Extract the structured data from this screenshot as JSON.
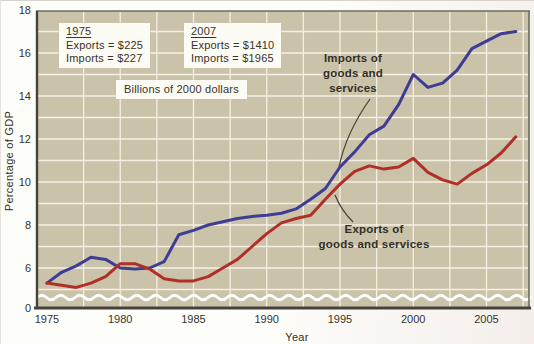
{
  "figure": {
    "y_axis_title": "Percentage of GDP",
    "x_axis_title": "Year",
    "note_box": "Billions of 2000 dollars",
    "legend_boxes": [
      {
        "title": "1975",
        "rows": [
          "Exports = $225",
          "Imports = $227"
        ]
      },
      {
        "title": "2007",
        "rows": [
          "Exports = $1410",
          "Imports = $1965"
        ]
      }
    ],
    "annotations": {
      "imports": {
        "lines": [
          "Imports of",
          "goods and",
          "services"
        ]
      },
      "exports": {
        "lines": [
          "Exports of",
          "goods and services"
        ]
      }
    }
  },
  "colors": {
    "plot_bg": "#cbc2aa",
    "grid": "#f4f0e2",
    "imports_line": "#3d3d94",
    "exports_line": "#b02f27",
    "axis": "#44423c",
    "frame": "#66705c",
    "text": "#37332c",
    "wave": "#ffffff",
    "leader": "#4c463a",
    "box_bg": "#fcfbf4"
  },
  "chart_data": {
    "type": "line",
    "xlabel": "Year",
    "ylabel": "Percentage of GDP",
    "ylim": [
      0,
      18
    ],
    "y_ticks": [
      0,
      6,
      8,
      10,
      12,
      14,
      16,
      18
    ],
    "x_ticks": [
      1975,
      1980,
      1985,
      1990,
      1995,
      2000,
      2005
    ],
    "y_gridline_step": 1,
    "x_gridline_step": 2.5,
    "axis_break_below": 5,
    "grid": true,
    "x": [
      1975,
      1976,
      1977,
      1978,
      1979,
      1980,
      1981,
      1982,
      1983,
      1984,
      1985,
      1986,
      1987,
      1988,
      1989,
      1990,
      1991,
      1992,
      1993,
      1994,
      1995,
      1996,
      1997,
      1998,
      1999,
      2000,
      2001,
      2002,
      2003,
      2004,
      2005,
      2006,
      2007
    ],
    "series": [
      {
        "name": "Imports of goods and services",
        "color": "#3d3d94",
        "values": [
          5.3,
          5.8,
          6.1,
          6.5,
          6.4,
          6.0,
          5.95,
          6.0,
          6.3,
          7.55,
          7.75,
          8.0,
          8.15,
          8.3,
          8.4,
          8.45,
          8.55,
          8.75,
          9.2,
          9.7,
          10.7,
          11.4,
          12.2,
          12.6,
          13.6,
          15.0,
          14.4,
          14.6,
          15.2,
          16.2,
          16.55,
          16.9,
          17.0
        ]
      },
      {
        "name": "Exports of goods and services",
        "color": "#b02f27",
        "values": [
          5.3,
          5.2,
          5.1,
          5.3,
          5.6,
          6.2,
          6.2,
          5.95,
          5.5,
          5.4,
          5.4,
          5.6,
          6.0,
          6.4,
          7.0,
          7.6,
          8.1,
          8.3,
          8.45,
          9.2,
          9.9,
          10.5,
          10.75,
          10.6,
          10.7,
          11.1,
          10.45,
          10.1,
          9.9,
          10.4,
          10.8,
          11.35,
          12.1
        ]
      }
    ]
  }
}
